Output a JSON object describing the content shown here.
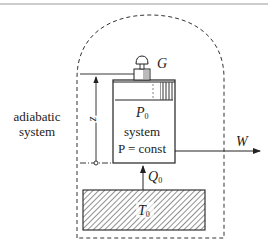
{
  "diagram": {
    "environment_label_line1": "adiabatic",
    "environment_label_line2": "system",
    "weight_label": "G",
    "system_pressure_label": "P",
    "system_pressure_sub": "0",
    "system_label": "system",
    "constraint_label": "P = const",
    "height_label": "z",
    "work_label": "W",
    "heat_label": "Q",
    "heat_sub": "0",
    "reservoir_label": "T",
    "reservoir_sub": "0"
  },
  "colors": {
    "line": "#222222",
    "top_rule": "#9a9a9a",
    "background": "#ffffff"
  }
}
